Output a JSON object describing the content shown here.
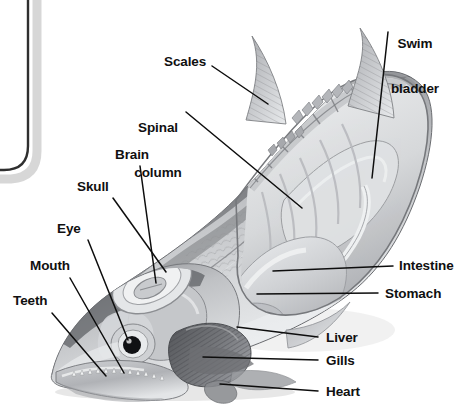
{
  "figure": {
    "background_color": "#ffffff",
    "label_color": "#101010",
    "leader_line_color": "#0d0d0d",
    "illustration_style": "grayscale-airbrush"
  },
  "panel": {
    "name": "rounded-panel-edge",
    "border_color": "#2b2b2b",
    "shadow_color": "#b9b9b9"
  },
  "labels": {
    "swim_bladder_line1": "Swim",
    "swim_bladder_line2": "bladder",
    "scales": "Scales",
    "spinal_line1": "Spinal",
    "spinal_line2": "column",
    "brain": "Brain",
    "skull": "Skull",
    "eye": "Eye",
    "mouth": "Mouth",
    "teeth": "Teeth",
    "intestine": "Intestine",
    "stomach": "Stomach",
    "liver": "Liver",
    "gills": "Gills",
    "heart": "Heart"
  },
  "parts": [
    {
      "id": "swim-bladder",
      "label": "Swim bladder",
      "side": "top-right"
    },
    {
      "id": "scales",
      "label": "Scales",
      "side": "top-left"
    },
    {
      "id": "spinal-column",
      "label": "Spinal column",
      "side": "top-left"
    },
    {
      "id": "brain",
      "label": "Brain",
      "side": "left"
    },
    {
      "id": "skull",
      "label": "Skull",
      "side": "left"
    },
    {
      "id": "eye",
      "label": "Eye",
      "side": "left"
    },
    {
      "id": "mouth",
      "label": "Mouth",
      "side": "left"
    },
    {
      "id": "teeth",
      "label": "Teeth",
      "side": "left"
    },
    {
      "id": "intestine",
      "label": "Intestine",
      "side": "right"
    },
    {
      "id": "stomach",
      "label": "Stomach",
      "side": "right"
    },
    {
      "id": "liver",
      "label": "Liver",
      "side": "right"
    },
    {
      "id": "gills",
      "label": "Gills",
      "side": "right"
    },
    {
      "id": "heart",
      "label": "Heart",
      "side": "right"
    }
  ]
}
